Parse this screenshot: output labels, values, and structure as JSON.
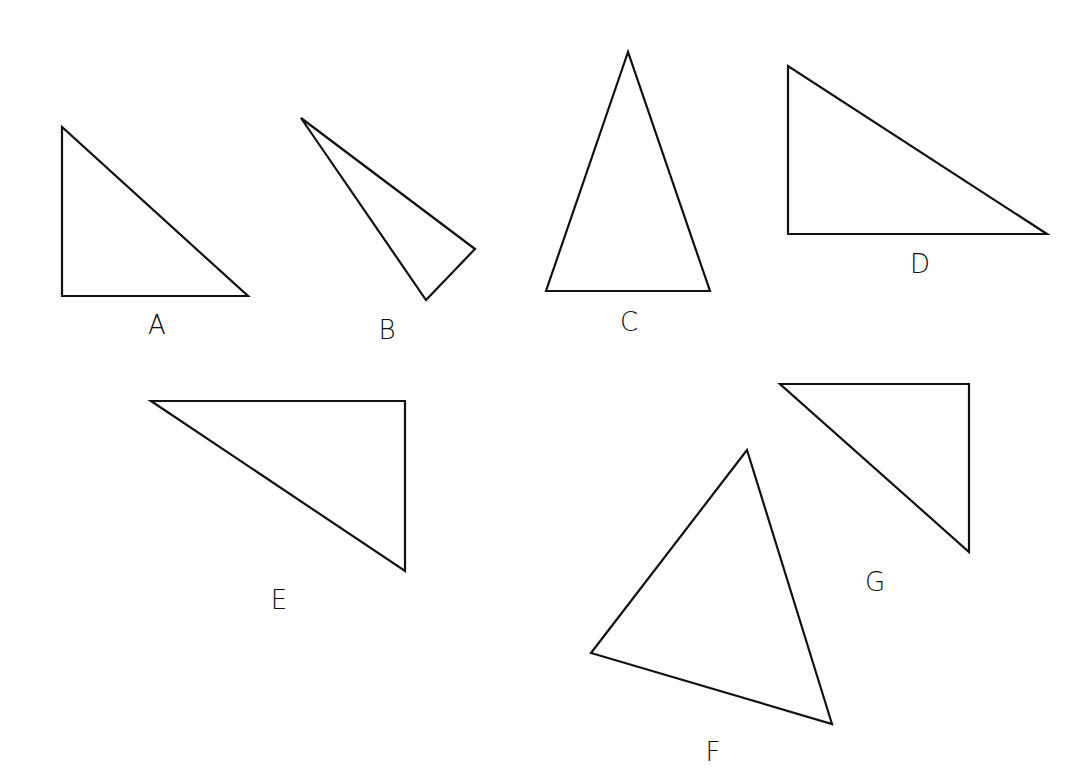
{
  "diagram": {
    "stroke_color": "#111111",
    "background": "#ffffff",
    "shapes": [
      {
        "label": "A",
        "points": "62,127 62,296 248,296",
        "label_pos": [
          157,
          325
        ]
      },
      {
        "label": "B",
        "points": "301,118 475,249 426,300",
        "label_pos": [
          387,
          330
        ]
      },
      {
        "label": "C",
        "points": "628,52 546,291 710,291",
        "label_pos": [
          629,
          322
        ]
      },
      {
        "label": "D",
        "points": "788,66 788,234 1047,234",
        "label_pos": [
          920,
          264
        ]
      },
      {
        "label": "E",
        "points": "151,401 405,401 405,571",
        "label_pos": [
          279,
          600
        ]
      },
      {
        "label": "F",
        "points": "747,450 591,653 832,724",
        "label_pos": [
          713,
          752
        ]
      },
      {
        "label": "G",
        "points": "780,384 969,384 969,552",
        "label_pos": [
          875,
          582
        ]
      }
    ]
  }
}
